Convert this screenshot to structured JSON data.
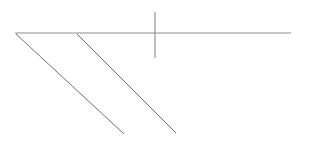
{
  "canvas": {
    "width": 310,
    "height": 142,
    "background_color": "#ffffff",
    "description": "Minimal technical line drawing: a long horizontal line, a short vertical line crossing it, and two parallel diagonal lines descending to the lower right."
  },
  "style": {
    "horizontal_color": "#8c8c8c",
    "vertical_color": "#8c8c8c",
    "diagonal_color": "#6e6e6e",
    "horizontal_width": 1.1,
    "vertical_width": 1.1,
    "diagonal_width": 1.0
  },
  "shapes": {
    "horizontal_line": {
      "name": "horizontal-line",
      "x1": 15,
      "y1": 33,
      "x2": 291,
      "y2": 33
    },
    "vertical_line": {
      "name": "vertical-line",
      "x1": 155,
      "y1": 12,
      "x2": 155,
      "y2": 58
    },
    "diagonal_line_1": {
      "name": "diagonal-line-left",
      "x1": 16,
      "y1": 34,
      "x2": 124,
      "y2": 134
    },
    "diagonal_line_2": {
      "name": "diagonal-line-right",
      "x1": 77,
      "y1": 34,
      "x2": 176,
      "y2": 133
    }
  }
}
